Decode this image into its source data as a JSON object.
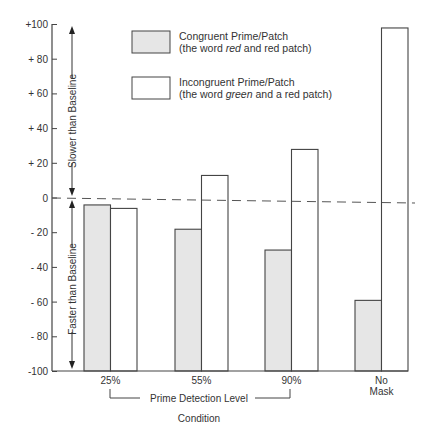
{
  "chart_data": {
    "type": "bar",
    "title": "",
    "xlabel": "Condition",
    "ylabel": "",
    "ylim": [
      -100,
      100
    ],
    "yticks": [
      "+100",
      "+ 80",
      "+ 60",
      "+ 40",
      "+ 20",
      "0",
      "- 20",
      "- 40",
      "- 60",
      "- 80",
      "-100"
    ],
    "ytick_values": [
      100,
      80,
      60,
      40,
      20,
      0,
      -20,
      -40,
      -60,
      -80,
      -100
    ],
    "categories": [
      "25%",
      "55%",
      "90%",
      "No Mask"
    ],
    "category_lines": [
      [
        "25%"
      ],
      [
        "55%"
      ],
      [
        "90%"
      ],
      [
        "No",
        "Mask"
      ]
    ],
    "series": [
      {
        "name": "Congruent Prime/Patch",
        "subtitle_parts": [
          "(the word ",
          "red",
          " and red patch)"
        ],
        "fill": "#e6e6e6",
        "values": [
          -4,
          -18,
          -30,
          -59
        ]
      },
      {
        "name": "Incongruent Prime/Patch",
        "subtitle_parts": [
          "(the word ",
          "green",
          " and a red patch)"
        ],
        "fill": "#ffffff",
        "values": [
          -6,
          13,
          28,
          98
        ]
      }
    ],
    "baseline": {
      "value": 0,
      "style": "dashed"
    },
    "annotations": {
      "slower": "Slower than Baseline",
      "faster": "Faster than Baseline",
      "group_bracket": "Prime Detection Level"
    },
    "grid": false,
    "legend_position": "top-center"
  }
}
